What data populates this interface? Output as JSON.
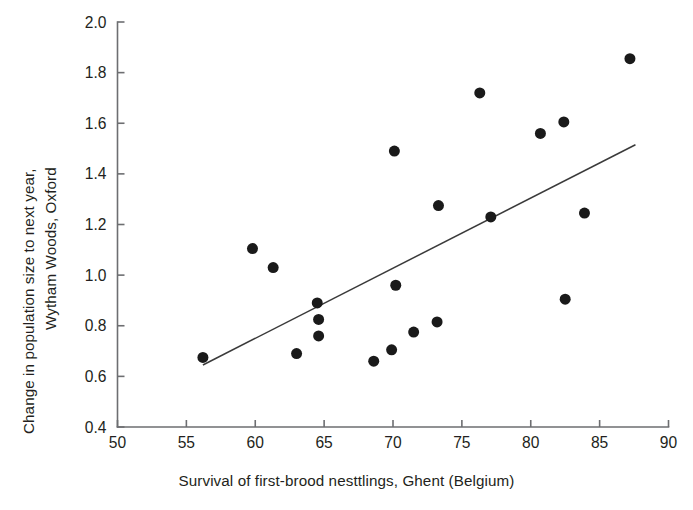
{
  "figure": {
    "background": "#ffffff",
    "point_color": "#1a1a1a",
    "axis_color": "#6d6e71",
    "line_color": "#3a3a3a"
  },
  "chart_data": {
    "type": "scatter",
    "title": "",
    "xlabel": "Survival of first-brood nesttlings, Ghent (Belgium)",
    "ylabel": "Change in population size to next year, Wytham Woods, Oxford",
    "ylabel_line1": "Change in population size to next year,",
    "ylabel_line2": "Wytham Woods, Oxford",
    "xlim": [
      50,
      90
    ],
    "ylim": [
      0.4,
      2.0
    ],
    "xticks": [
      50,
      55,
      60,
      65,
      70,
      75,
      80,
      85,
      90
    ],
    "xtick_labels": [
      "50",
      "55",
      "60",
      "65",
      "70",
      "75",
      "80",
      "85",
      "90"
    ],
    "yticks": [
      0.4,
      0.6,
      0.8,
      1.0,
      1.2,
      1.4,
      1.6,
      1.8,
      2.0
    ],
    "ytick_labels": [
      "0.4",
      "0.6",
      "0.8",
      "1.0",
      "1.2",
      "1.4",
      "1.6",
      "1.8",
      "2.0"
    ],
    "grid": false,
    "legend": null,
    "marker": "filled-circle",
    "marker_size_px": 11,
    "points": [
      {
        "x": 56.2,
        "y": 0.675
      },
      {
        "x": 59.8,
        "y": 1.105
      },
      {
        "x": 61.3,
        "y": 1.03
      },
      {
        "x": 63.0,
        "y": 0.69
      },
      {
        "x": 64.5,
        "y": 0.89
      },
      {
        "x": 64.6,
        "y": 0.825
      },
      {
        "x": 64.6,
        "y": 0.76
      },
      {
        "x": 68.6,
        "y": 0.66
      },
      {
        "x": 69.9,
        "y": 0.705
      },
      {
        "x": 70.1,
        "y": 1.49
      },
      {
        "x": 70.2,
        "y": 0.96
      },
      {
        "x": 71.5,
        "y": 0.775
      },
      {
        "x": 73.2,
        "y": 0.815
      },
      {
        "x": 73.3,
        "y": 1.275
      },
      {
        "x": 76.3,
        "y": 1.72
      },
      {
        "x": 77.1,
        "y": 1.23
      },
      {
        "x": 80.7,
        "y": 1.56
      },
      {
        "x": 82.4,
        "y": 1.605
      },
      {
        "x": 82.5,
        "y": 0.905
      },
      {
        "x": 83.9,
        "y": 1.245
      },
      {
        "x": 87.2,
        "y": 1.855
      }
    ],
    "trendline": {
      "type": "linear-fit",
      "x_start": 56.2,
      "y_start": 0.645,
      "x_end": 87.6,
      "y_end": 1.515
    }
  }
}
